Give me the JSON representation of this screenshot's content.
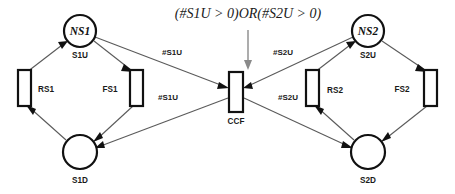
{
  "diagram": {
    "type": "petri-net",
    "title": "",
    "guard": {
      "text": "(#S1U > 0)OR(#S2U > 0)",
      "x": 248,
      "y": 15
    },
    "places": [
      {
        "id": "NS1",
        "inner_label": "NS1",
        "caption": "S1U",
        "cx": 80,
        "cy": 31,
        "r": 16
      },
      {
        "id": "S1D",
        "inner_label": "",
        "caption": "S1D",
        "cx": 80,
        "cy": 152,
        "r": 17
      },
      {
        "id": "NS2",
        "inner_label": "NS2",
        "caption": "S2U",
        "cx": 368,
        "cy": 31,
        "r": 16
      },
      {
        "id": "S2D",
        "inner_label": "",
        "caption": "S2D",
        "cx": 368,
        "cy": 152,
        "r": 17
      }
    ],
    "transitions": [
      {
        "id": "RS1",
        "caption": "RS1",
        "x": 18,
        "y": 70,
        "w": 13,
        "h": 36,
        "label_x": 46,
        "label_y": 90
      },
      {
        "id": "FS1",
        "caption": "FS1",
        "x": 130,
        "y": 70,
        "w": 13,
        "h": 36,
        "label_x": 110,
        "label_y": 90
      },
      {
        "id": "CCF",
        "caption": "CCF",
        "x": 229,
        "y": 72,
        "w": 14,
        "h": 40,
        "label_x": 236,
        "label_y": 122
      },
      {
        "id": "RS2",
        "caption": "RS2",
        "x": 306,
        "y": 70,
        "w": 13,
        "h": 36,
        "label_x": 335,
        "label_y": 91
      },
      {
        "id": "FS2",
        "caption": "FS2",
        "x": 424,
        "y": 70,
        "w": 13,
        "h": 36,
        "label_x": 402,
        "label_y": 90
      }
    ],
    "arcs": [
      {
        "id": "arc-rs1-ns1",
        "from": "RS1",
        "to": "NS1",
        "label": ""
      },
      {
        "id": "arc-ns1-fs1",
        "from": "NS1",
        "to": "FS1",
        "label": ""
      },
      {
        "id": "arc-fs1-s1d",
        "from": "FS1",
        "to": "S1D",
        "label": ""
      },
      {
        "id": "arc-s1d-rs1",
        "from": "S1D",
        "to": "RS1",
        "label": ""
      },
      {
        "id": "arc-ns1-ccf",
        "from": "NS1",
        "to": "CCF",
        "label": "#S1U",
        "label_x": 172,
        "label_y": 53
      },
      {
        "id": "arc-ccf-s1d",
        "from": "CCF",
        "to": "S1D",
        "label": "#S1U",
        "label_x": 168,
        "label_y": 98
      },
      {
        "id": "arc-rs2-ns2",
        "from": "RS2",
        "to": "NS2",
        "label": ""
      },
      {
        "id": "arc-ns2-fs2",
        "from": "NS2",
        "to": "FS2",
        "label": ""
      },
      {
        "id": "arc-fs2-s2d",
        "from": "FS2",
        "to": "S2D",
        "label": ""
      },
      {
        "id": "arc-s2d-rs2",
        "from": "S2D",
        "to": "RS2",
        "label": ""
      },
      {
        "id": "arc-ns2-ccf",
        "from": "NS2",
        "to": "CCF",
        "label": "#S2U",
        "label_x": 283,
        "label_y": 53
      },
      {
        "id": "arc-ccf-s2d",
        "from": "CCF",
        "to": "S2D",
        "label": "#S2U",
        "label_x": 288,
        "label_y": 98
      }
    ],
    "guard_arrow": {
      "x": 248,
      "y_start": 28,
      "y_end": 68
    }
  }
}
